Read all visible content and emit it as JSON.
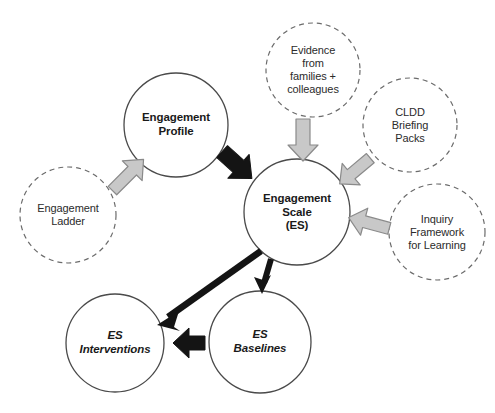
{
  "diagram": {
    "colors": {
      "node_stroke": "#4a4a4a",
      "node_fill": "#ffffff",
      "dashed_stroke": "#6b6b6b",
      "grey_arrow_fill": "#c8c8c8",
      "grey_arrow_stroke": "#8a8a8a",
      "black_arrow_fill": "#141414",
      "text": "#1a1a1a",
      "background": "#ffffff"
    },
    "nodes": [
      {
        "id": "engagement-profile",
        "label": "Engagement\nProfile",
        "style": "solid",
        "text_style": "bold",
        "cx": 176,
        "cy": 125,
        "r": 52
      },
      {
        "id": "engagement-scale",
        "label": "Engagement\nScale\n(ES)",
        "style": "solid",
        "text_style": "bold",
        "cx": 297,
        "cy": 212,
        "r": 53
      },
      {
        "id": "engagement-ladder",
        "label": "Engagement\nLadder",
        "style": "dashed",
        "text_style": "regular",
        "cx": 68,
        "cy": 215,
        "r": 48
      },
      {
        "id": "evidence-families-colleagues",
        "label": "Evidence\nfrom\nfamilies +\ncolleagues",
        "style": "dashed",
        "text_style": "regular",
        "cx": 313,
        "cy": 70,
        "r": 47
      },
      {
        "id": "cldd-briefing-packs",
        "label": "CLDD\nBriefing\nPacks",
        "style": "dashed",
        "text_style": "regular",
        "cx": 410,
        "cy": 125,
        "r": 47
      },
      {
        "id": "inquiry-framework-for-learning",
        "label": "Inquiry\nFramework\nfor Learning",
        "style": "dashed",
        "text_style": "regular",
        "cx": 437,
        "cy": 232,
        "r": 48
      },
      {
        "id": "es-interventions",
        "label": "ES\nInterventions",
        "style": "solid",
        "text_style": "bold-italic",
        "cx": 115,
        "cy": 343,
        "r": 49
      },
      {
        "id": "es-baselines",
        "label": "ES\nBaselines",
        "style": "solid",
        "text_style": "bold-italic",
        "cx": 260,
        "cy": 342,
        "r": 51
      }
    ],
    "arrows": [
      {
        "id": "ladder-to-profile",
        "from": "engagement-ladder",
        "to": "engagement-profile",
        "color": "grey",
        "shape": "block"
      },
      {
        "id": "evidence-to-scale",
        "from": "evidence-families-colleagues",
        "to": "engagement-scale",
        "color": "grey",
        "shape": "block"
      },
      {
        "id": "cldd-to-scale",
        "from": "cldd-briefing-packs",
        "to": "engagement-scale",
        "color": "grey",
        "shape": "block"
      },
      {
        "id": "inquiry-to-scale",
        "from": "inquiry-framework-for-learning",
        "to": "engagement-scale",
        "color": "grey",
        "shape": "block"
      },
      {
        "id": "profile-to-scale",
        "from": "engagement-profile",
        "to": "engagement-scale",
        "color": "black",
        "shape": "block"
      },
      {
        "id": "scale-to-interventions",
        "from": "engagement-scale",
        "to": "es-interventions",
        "color": "black",
        "shape": "line"
      },
      {
        "id": "scale-to-baselines",
        "from": "engagement-scale",
        "to": "es-baselines",
        "color": "black",
        "shape": "line"
      },
      {
        "id": "baselines-to-interventions",
        "from": "es-baselines",
        "to": "es-interventions",
        "color": "black",
        "shape": "block"
      }
    ]
  }
}
